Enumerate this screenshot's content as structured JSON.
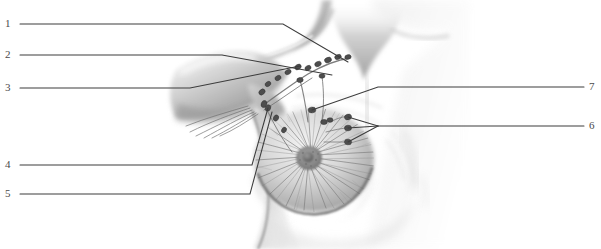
{
  "figure": {
    "background_color": "#ffffff",
    "line_color": "#3c3c3c",
    "text_color": "#4a4a4a",
    "width": 601,
    "height": 249
  },
  "labels": {
    "left": [
      {
        "id": "1",
        "text": "1",
        "x": 5,
        "y": 18,
        "leader_end_x": 283,
        "leader_end_y": 24
      },
      {
        "id": "2",
        "text": "2",
        "x": 5,
        "y": 49,
        "leader_end_x": 222,
        "leader_end_y": 55
      },
      {
        "id": "3",
        "text": "3",
        "x": 5,
        "y": 82,
        "leader_end_x": 190,
        "leader_end_y": 88
      },
      {
        "id": "4",
        "text": "4",
        "x": 5,
        "y": 159,
        "leader_end_x": 252,
        "leader_end_y": 165
      },
      {
        "id": "5",
        "text": "5",
        "x": 5,
        "y": 188,
        "leader_end_x": 250,
        "leader_end_y": 194
      }
    ],
    "right": [
      {
        "id": "7",
        "text": "7",
        "x": 589,
        "y": 81,
        "leader_end_x": 378,
        "leader_end_y": 87
      },
      {
        "id": "6",
        "text": "6",
        "x": 589,
        "y": 120,
        "leader_end_x": 378,
        "leader_end_y": 126
      }
    ]
  },
  "leaders": {
    "l1": {
      "from": [
        20,
        24
      ],
      "bend": [
        283,
        24
      ],
      "to": [
        348,
        62
      ]
    },
    "l2": {
      "from": [
        20,
        55
      ],
      "bend": [
        222,
        55
      ],
      "to": [
        332,
        75
      ]
    },
    "l3": {
      "from": [
        20,
        88
      ],
      "bend": [
        190,
        88
      ],
      "to": [
        300,
        66
      ]
    },
    "l4": {
      "from": [
        20,
        165
      ],
      "bend": [
        252,
        165
      ],
      "to": [
        268,
        108
      ]
    },
    "l5": {
      "from": [
        20,
        194
      ],
      "bend": [
        250,
        194
      ],
      "to": [
        272,
        112
      ]
    },
    "l7": {
      "from": [
        584,
        87
      ],
      "bend": [
        378,
        87
      ],
      "to": [
        312,
        110
      ]
    },
    "l6": {
      "from": [
        584,
        126
      ],
      "bend": [
        378,
        126
      ],
      "nodes": [
        [
          348,
          117
        ],
        [
          348,
          128
        ],
        [
          348,
          142
        ]
      ]
    }
  },
  "anatomy": {
    "parts": [
      {
        "name": "neck-suprasternal-notch"
      },
      {
        "name": "clavicle-supraclavicular-region"
      },
      {
        "name": "shoulder-upper-arm"
      },
      {
        "name": "axilla-armpit"
      },
      {
        "name": "breast-mound"
      },
      {
        "name": "areola"
      },
      {
        "name": "nipple"
      },
      {
        "name": "lateral-thoracic-wall"
      },
      {
        "name": "lymph-node-chain-apical"
      },
      {
        "name": "lymph-node-chain-axillary"
      },
      {
        "name": "lymph-node-chain-internal-mammary"
      },
      {
        "name": "lymphatic-vessels-radiating"
      }
    ]
  }
}
